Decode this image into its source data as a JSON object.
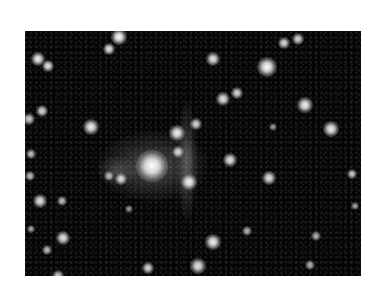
{
  "image": {
    "description": "Grayscale astronomical image of a star field with a bright central galaxy and a faint vertical tidal stream",
    "background_color": "#050505",
    "page_background": "#ffffff",
    "frame": {
      "x": 25,
      "y": 31,
      "width": 336,
      "height": 245
    }
  },
  "diffuse_features": [
    {
      "name": "central-galaxy-halo",
      "x": 128,
      "y": 135,
      "w": 110,
      "h": 70,
      "opacity": 0.35
    },
    {
      "name": "vertical-stream",
      "x": 162,
      "y": 130,
      "w": 20,
      "h": 120,
      "opacity": 0.35
    },
    {
      "name": "left-halo",
      "x": 92,
      "y": 140,
      "w": 40,
      "h": 30,
      "opacity": 0.25
    }
  ],
  "stars": [
    {
      "x": 127,
      "y": 135,
      "r": 16,
      "b": 1.0
    },
    {
      "x": 13,
      "y": 28,
      "r": 7,
      "b": 0.95
    },
    {
      "x": 23,
      "y": 35,
      "r": 6,
      "b": 0.9
    },
    {
      "x": 94,
      "y": 6,
      "r": 8,
      "b": 1.0
    },
    {
      "x": 84,
      "y": 18,
      "r": 6,
      "b": 0.9
    },
    {
      "x": 188,
      "y": 28,
      "r": 7,
      "b": 0.9
    },
    {
      "x": 242,
      "y": 36,
      "r": 10,
      "b": 1.0
    },
    {
      "x": 259,
      "y": 12,
      "r": 6,
      "b": 0.85
    },
    {
      "x": 273,
      "y": 8,
      "r": 6,
      "b": 0.85
    },
    {
      "x": 198,
      "y": 68,
      "r": 7,
      "b": 0.9
    },
    {
      "x": 212,
      "y": 62,
      "r": 6,
      "b": 0.85
    },
    {
      "x": 280,
      "y": 74,
      "r": 8,
      "b": 0.95
    },
    {
      "x": 306,
      "y": 98,
      "r": 8,
      "b": 0.95
    },
    {
      "x": 17,
      "y": 80,
      "r": 6,
      "b": 0.85
    },
    {
      "x": 4,
      "y": 88,
      "r": 6,
      "b": 0.8
    },
    {
      "x": 66,
      "y": 96,
      "r": 8,
      "b": 0.95
    },
    {
      "x": 152,
      "y": 102,
      "r": 8,
      "b": 0.95
    },
    {
      "x": 171,
      "y": 93,
      "r": 6,
      "b": 0.85
    },
    {
      "x": 153,
      "y": 121,
      "r": 6,
      "b": 0.85
    },
    {
      "x": 205,
      "y": 129,
      "r": 7,
      "b": 0.9
    },
    {
      "x": 96,
      "y": 148,
      "r": 6,
      "b": 0.85
    },
    {
      "x": 84,
      "y": 145,
      "r": 5,
      "b": 0.7
    },
    {
      "x": 164,
      "y": 151,
      "r": 8,
      "b": 0.95
    },
    {
      "x": 244,
      "y": 147,
      "r": 7,
      "b": 0.9
    },
    {
      "x": 6,
      "y": 123,
      "r": 5,
      "b": 0.75
    },
    {
      "x": 5,
      "y": 145,
      "r": 5,
      "b": 0.75
    },
    {
      "x": 15,
      "y": 170,
      "r": 7,
      "b": 0.9
    },
    {
      "x": 37,
      "y": 170,
      "r": 5,
      "b": 0.75
    },
    {
      "x": 38,
      "y": 207,
      "r": 7,
      "b": 0.9
    },
    {
      "x": 22,
      "y": 219,
      "r": 5,
      "b": 0.75
    },
    {
      "x": 6,
      "y": 198,
      "r": 4,
      "b": 0.65
    },
    {
      "x": 188,
      "y": 211,
      "r": 8,
      "b": 0.95
    },
    {
      "x": 173,
      "y": 235,
      "r": 8,
      "b": 0.9
    },
    {
      "x": 123,
      "y": 237,
      "r": 6,
      "b": 0.85
    },
    {
      "x": 222,
      "y": 200,
      "r": 5,
      "b": 0.7
    },
    {
      "x": 327,
      "y": 143,
      "r": 5,
      "b": 0.8
    },
    {
      "x": 330,
      "y": 175,
      "r": 4,
      "b": 0.65
    },
    {
      "x": 291,
      "y": 205,
      "r": 5,
      "b": 0.7
    },
    {
      "x": 285,
      "y": 234,
      "r": 5,
      "b": 0.7
    },
    {
      "x": 33,
      "y": 245,
      "r": 6,
      "b": 0.8
    },
    {
      "x": 248,
      "y": 96,
      "r": 4,
      "b": 0.6
    },
    {
      "x": 104,
      "y": 178,
      "r": 4,
      "b": 0.6
    }
  ]
}
